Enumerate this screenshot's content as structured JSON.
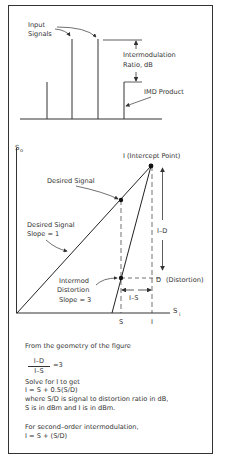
{
  "spectrum": {
    "input_signals_label": [
      "Input",
      "Signals"
    ],
    "imr_label": [
      "Intermodulation",
      "Ratio, dB"
    ],
    "imd_product_label": "IMD Product",
    "lines": [
      {
        "x": 47,
        "top": 82,
        "role": "imd"
      },
      {
        "x": 72,
        "top": 39,
        "role": "input"
      },
      {
        "x": 98,
        "top": 39,
        "role": "input"
      },
      {
        "x": 124,
        "top": 82,
        "role": "imd"
      }
    ]
  },
  "intercept_plot": {
    "y_axis_label": "S",
    "y_axis_sub": "o",
    "x_axis_label": "S",
    "x_axis_sub": "i",
    "intercept_label": "I (Intercept Point)",
    "desired_signal_label": "Desired Signal",
    "desired_slope_label": [
      "Desired Signal",
      "Slope = 1"
    ],
    "intermod_label": [
      "Intermod",
      "Distortion",
      "Slope = 3"
    ],
    "i_minus_d_label": "I–D",
    "d_label": "D",
    "distortion_label": "(Distortion)",
    "i_minus_s_label": "I–S",
    "x_tick_s": "S",
    "x_tick_i": "I"
  },
  "explanation": {
    "geometry_intro": "From the geometry of the figure",
    "fraction_num": "I–D",
    "fraction_den": "I–S",
    "fraction_eq": "=3",
    "solve_intro": "Solve for I to get",
    "formula_third": "I = S + 0.5(S/D)",
    "where_line": "where S/D is signal to distortion ratio in dB,",
    "units_line": "S is in dBm and I is in dBm.",
    "second_order_intro": "For second–order intermodulation,",
    "formula_second": "I = S + (S/D)"
  }
}
